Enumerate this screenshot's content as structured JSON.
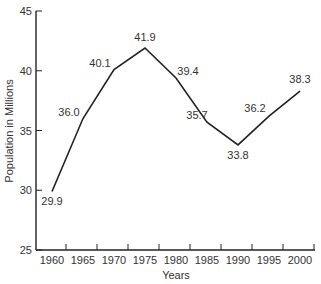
{
  "chart_data": {
    "type": "line",
    "title": "",
    "xlabel": "Years",
    "ylabel": "Population in Millions",
    "x": [
      "1960",
      "1965",
      "1970",
      "1975",
      "1980",
      "1985",
      "1990",
      "1995",
      "2000"
    ],
    "series": [
      {
        "name": "Population",
        "values": [
          29.9,
          36.0,
          40.1,
          41.9,
          39.4,
          35.7,
          33.8,
          36.2,
          38.3
        ]
      }
    ],
    "data_labels": [
      "29.9",
      "36.0",
      "40.1",
      "41.9",
      "39.4",
      "35.7",
      "33.8",
      "36.2",
      "38.3"
    ],
    "ylim": [
      25,
      45
    ],
    "yticks": [
      "25",
      "30",
      "35",
      "40",
      "45"
    ],
    "grid": false,
    "line_color": "#222222"
  }
}
